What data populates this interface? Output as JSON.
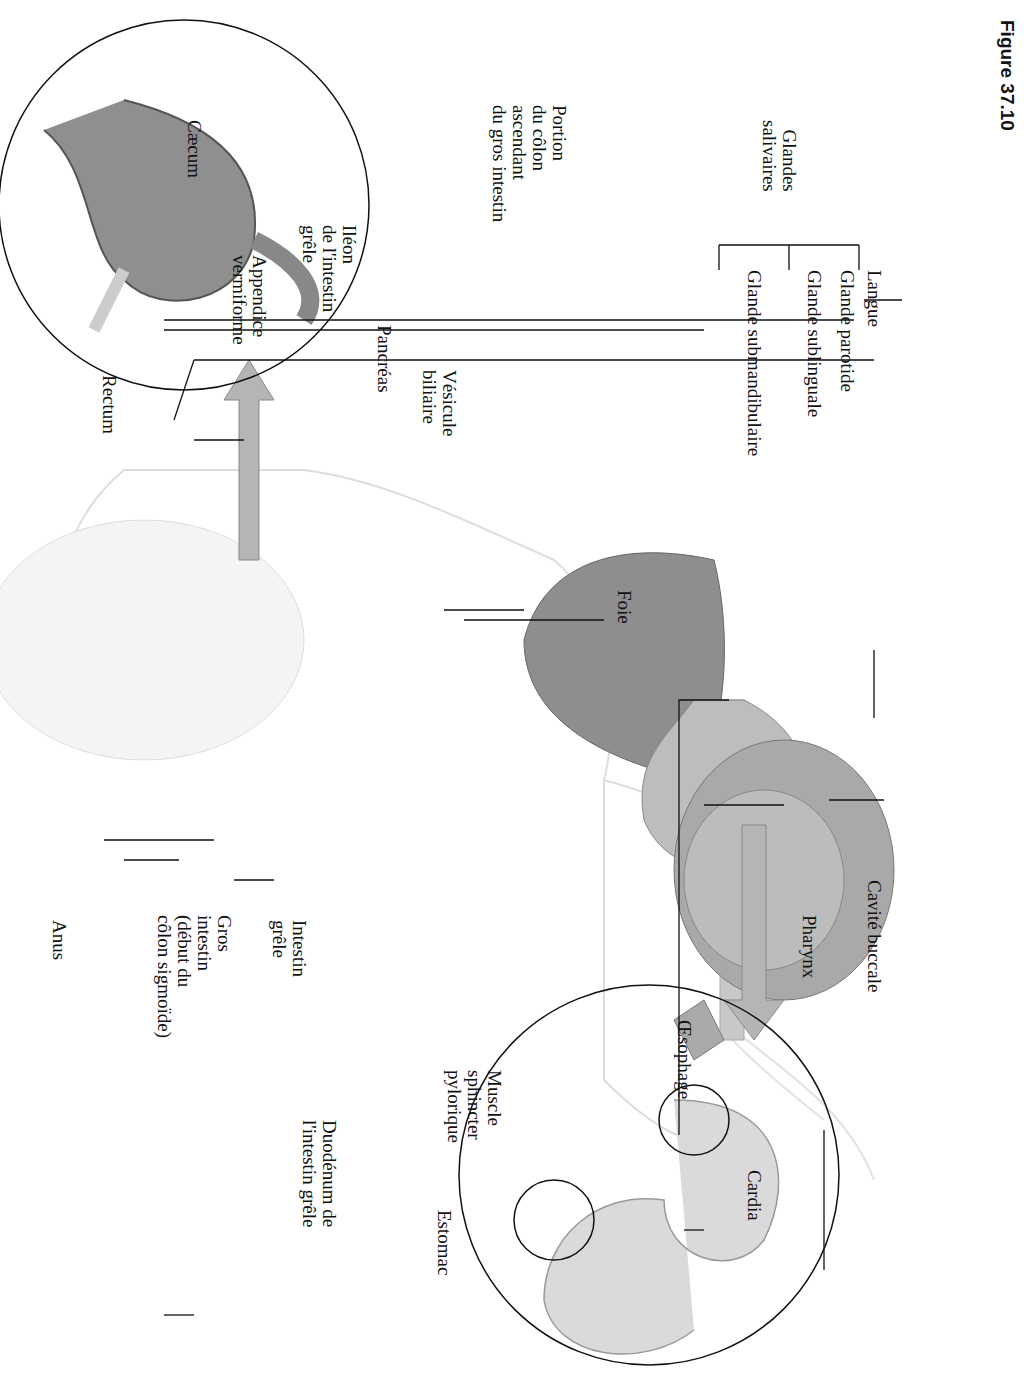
{
  "figure": {
    "caption": "Figure 37.10"
  },
  "labels": {
    "langue": "Langue",
    "glandes_salivaires": "Glandes\nsalivaires",
    "glande_parotide": "Glande parotide",
    "glande_sublinguale": "Glande sublinguale",
    "glande_submandibulaire": "Glande submandibulaire",
    "cavite_buccale": "Cavité buccale",
    "pharynx": "Pharynx",
    "oesophage": "Œsophage",
    "cardia": "Cardia",
    "foie": "Foie",
    "vesicule_biliaire": "Vésicule\nbiliaire",
    "pancreas": "Pancréas",
    "rectum": "Rectum",
    "anus": "Anus",
    "intestin_grele": "Intestin\ngrêle",
    "gros_intestin": "Gros\nintestin\n(début du\ncôlon sigmoïde)",
    "portion_colon": "Portion\ndu côlon\nascendant\ndu gros intestin",
    "caecum": "Cæcum",
    "ileon": "Iléon\nde l'intestin\ngrêle",
    "appendice": "Appendice\nvermiforme",
    "muscle_sphincter": "Muscle\nsphincter\npylorique",
    "duodenum": "Duodénum de\nl'intestin grêle",
    "estomac": "Estomac"
  },
  "colors": {
    "ink": "#111111",
    "organ": "#9a9a9a",
    "organ_light": "#cfcfcf",
    "body": "#e6e6e6",
    "arrow": "#b5b5b5"
  }
}
